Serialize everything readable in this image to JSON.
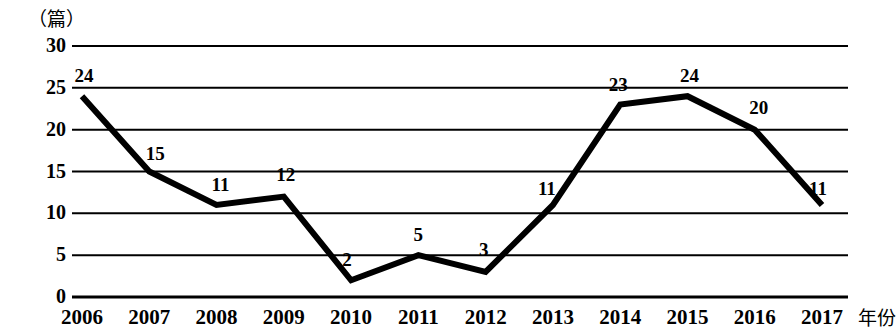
{
  "chart_data": {
    "type": "line",
    "title": "",
    "xlabel": "年份",
    "ylabel": "（篇）",
    "categories": [
      "2006",
      "2007",
      "2008",
      "2009",
      "2010",
      "2011",
      "2012",
      "2013",
      "2014",
      "2015",
      "2016",
      "2017"
    ],
    "values": [
      24,
      15,
      11,
      12,
      2,
      5,
      3,
      11,
      23,
      24,
      20,
      11
    ],
    "point_labels": [
      "24",
      "15",
      "11",
      "12",
      "2",
      "5",
      "3",
      "11",
      "23",
      "24",
      "20",
      "11"
    ],
    "ylim": [
      0,
      30
    ],
    "ytick_labels": [
      "30",
      "25",
      "20",
      "15",
      "10",
      "5",
      "0"
    ],
    "ytick_values": [
      30,
      25,
      20,
      15,
      10,
      5,
      0
    ],
    "grid": true,
    "grid_orientation": "horizontal",
    "legend": "none",
    "series_color": "#000000",
    "grid_color": "#000000",
    "background_color": "#ffffff",
    "line_width": 6
  }
}
